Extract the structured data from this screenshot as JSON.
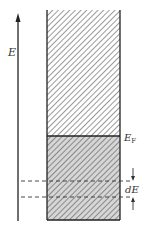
{
  "diagram": {
    "axis_label": "E",
    "fermi_label": "E",
    "fermi_subscript": "F",
    "interval_label": "dE",
    "colors": {
      "line": "#222222",
      "hatch": "#555555",
      "lower_fill": "#d6d6d6",
      "upper_fill": "#ffffff"
    }
  }
}
